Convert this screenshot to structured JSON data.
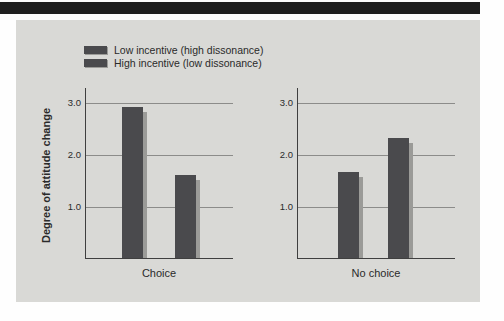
{
  "colors": {
    "page_bg": "#fefefe",
    "top_bar": "#1f1f1f",
    "panel_bg": "#d9d9d6",
    "bar": "#4a4a4d",
    "bar_shadow": "#9b9b98",
    "grid": "#8c8c8a",
    "axis": "#3f3f3f",
    "text": "#2a2a2a"
  },
  "chart_data": {
    "type": "bar",
    "title": "",
    "categories": [
      "Choice",
      "No choice"
    ],
    "series": [
      {
        "name": "Low incentive (high dissonance)",
        "values": [
          2.9,
          1.65
        ],
        "color": "#4a4a4d"
      },
      {
        "name": "High incentive (low dissonance)",
        "values": [
          1.6,
          2.3
        ],
        "color": "#4a4a4d"
      }
    ],
    "xlabel": "",
    "ylabel": "Degree of attitude change",
    "yticks": [
      {
        "label": "3.0",
        "value": 3.0
      },
      {
        "label": "2.0",
        "value": 2.0
      },
      {
        "label": "1.0",
        "value": 1.0
      }
    ],
    "ylim": [
      0,
      3.3
    ],
    "grid": true,
    "legend_position": "top-left"
  }
}
